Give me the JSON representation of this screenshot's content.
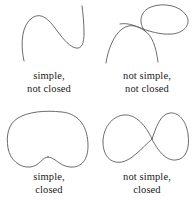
{
  "figure": {
    "background_color": "#ffffff",
    "stroke_color": "#5a5a5a",
    "text_color": "#1a1a1a"
  },
  "panels": [
    {
      "id": "simple-not-closed",
      "position": "top-left",
      "curve_name": "simple-open-curve",
      "caption_line1": "simple,",
      "caption_line2": "not closed",
      "self_intersections": 0,
      "closed": false
    },
    {
      "id": "not-simple-not-closed",
      "position": "top-right",
      "curve_name": "self-intersecting-open-curve",
      "caption_line1": "not simple,",
      "caption_line2": "not closed",
      "self_intersections": 1,
      "closed": false
    },
    {
      "id": "simple-closed",
      "position": "bottom-left",
      "curve_name": "simple-closed-bean-curve",
      "caption_line1": "simple,",
      "caption_line2": "closed",
      "self_intersections": 0,
      "closed": true
    },
    {
      "id": "not-simple-closed",
      "position": "bottom-right",
      "curve_name": "figure-eight-closed-curve",
      "caption_line1": "not simple,",
      "caption_line2": "closed",
      "self_intersections": 1,
      "closed": true
    }
  ]
}
